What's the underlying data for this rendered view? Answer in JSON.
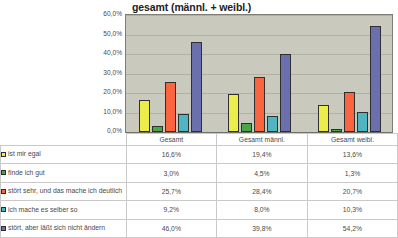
{
  "chart_data": {
    "type": "bar",
    "title": "gesamt (männl. + weibl.)",
    "xlabel": "",
    "ylabel": "",
    "ylim": [
      0,
      60
    ],
    "grid": true,
    "legend_position": "table-below",
    "categories": [
      "Gesamt",
      "Gesamt männl.",
      "Gesamt weibl."
    ],
    "ytick_labels": [
      "60,0%",
      "50,0%",
      "40,0%",
      "30,0%",
      "20,0%",
      "10,0%",
      "0,0%"
    ],
    "ytick_values": [
      60,
      50,
      40,
      30,
      20,
      10,
      0
    ],
    "series": [
      {
        "name": "ist mir egal",
        "color": "#ecec4a",
        "values": [
          16.6,
          19.4,
          13.6
        ],
        "labels": [
          "16,6%",
          "19,4%",
          "13,6%"
        ]
      },
      {
        "name": "finde ich gut",
        "color": "#4ba64b",
        "values": [
          3.0,
          4.5,
          1.3
        ],
        "labels": [
          "3,0%",
          "4,5%",
          "1,3%"
        ]
      },
      {
        "name": "stört sehr, und das mache ich deutlich",
        "color": "#fa6540",
        "values": [
          25.7,
          28.4,
          20.7
        ],
        "labels": [
          "25,7%",
          "28,4%",
          "20,7%"
        ]
      },
      {
        "name": "ich mache es selber so",
        "color": "#4fb5c0",
        "values": [
          9.2,
          8.0,
          10.3
        ],
        "labels": [
          "9,2%",
          "8,0%",
          "10,3%"
        ]
      },
      {
        "name": "stört, aber läßt sich nicht ändern",
        "color": "#6a6fae",
        "values": [
          46.0,
          39.8,
          54.2
        ],
        "labels": [
          "46,0%",
          "39,8%",
          "54,2%"
        ]
      }
    ]
  },
  "table": {
    "header_blank": "",
    "columns": [
      "Gesamt",
      "Gesamt männl.",
      "Gesamt weibl."
    ],
    "rows": [
      {
        "label": "ist mir egal",
        "color": "#ecec4a",
        "values": [
          "16,6%",
          "19,4%",
          "13,6%"
        ]
      },
      {
        "label": "finde ich gut",
        "color": "#4ba64b",
        "values": [
          "3,0%",
          "4,5%",
          "1,3%"
        ]
      },
      {
        "label": "stört sehr, und das mache ich deutlich",
        "color": "#fa6540",
        "values": [
          "25,7%",
          "28,4%",
          "20,7%"
        ]
      },
      {
        "label": "ich mache es selber so",
        "color": "#4fb5c0",
        "values": [
          "9,2%",
          "8,0%",
          "10,3%"
        ]
      },
      {
        "label": "stört, aber läßt sich nicht ändern",
        "color": "#6a6fae",
        "values": [
          "46,0%",
          "39,8%",
          "54,2%"
        ]
      }
    ]
  },
  "colors": {
    "plot_background": "#c9c9bd",
    "plot_border": "#7d7d74",
    "gridline": "#b0b0a4",
    "page_background": "#ffffff",
    "text": "#4a4a4a"
  }
}
